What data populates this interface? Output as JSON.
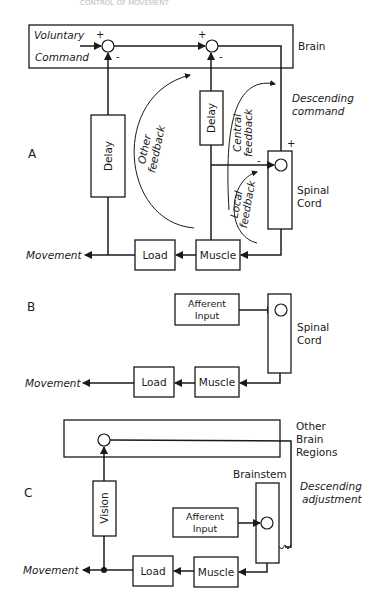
{
  "header": {
    "running_title": "CONTROL OF MOVEMENT"
  },
  "panels": {
    "A": {
      "label": "A",
      "voluntary": "Voluntary",
      "command": "Command",
      "brain": "Brain",
      "descending_1": "Descending",
      "descending_2": "command",
      "delay_large": "Delay",
      "delay_small": "Delay",
      "other_feedback_1": "Other",
      "other_feedback_2": "feedback",
      "central_feedback_1": "Central",
      "central_feedback_2": "feedback",
      "local_feedback_1": "Local",
      "local_feedback_2": "feedback",
      "spinal_1": "Spinal",
      "spinal_2": "Cord",
      "load": "Load",
      "muscle": "Muscle",
      "movement": "Movement",
      "plus": "+",
      "minus": "-"
    },
    "B": {
      "label": "B",
      "afferent_1": "Afferent",
      "afferent_2": "Input",
      "spinal_1": "Spinal",
      "spinal_2": "Cord",
      "load": "Load",
      "muscle": "Muscle",
      "movement": "Movement"
    },
    "C": {
      "label": "C",
      "other_1": "Other",
      "other_2": "Brain",
      "other_3": "Regions",
      "brainstem": "Brainstem",
      "descending_1": "Descending",
      "descending_2": "adjustment",
      "vision": "Vision",
      "afferent_1": "Afferent",
      "afferent_2": "Input",
      "load": "Load",
      "muscle": "Muscle",
      "movement": "Movement"
    }
  }
}
